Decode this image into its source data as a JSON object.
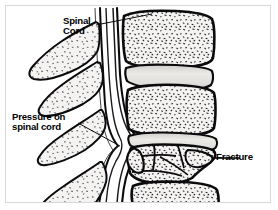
{
  "figure": {
    "kind": "medical-illustration",
    "style": "black and white line drawing with stippled bone texture",
    "background_color": "#ffffff",
    "ink_color": "#000000",
    "frame_color": "#d8d8d8",
    "bone_fill": "#f2f1ef",
    "disc_fill": "#e6e5e3",
    "canal_fill": "#ffffff"
  },
  "labels": {
    "spinal_cord": {
      "line1": "Spinal",
      "line2": "Cord"
    },
    "pressure": {
      "line1": "Pressure on",
      "line2": "spinal cord"
    },
    "fracture": {
      "text": "Fracture"
    }
  },
  "anatomy": {
    "spinous_processes_count": 4,
    "vertebral_bodies_count": 4,
    "intervertebral_discs_count": 3,
    "fractured_vertebra_index": 3,
    "fragment_count": 6
  }
}
